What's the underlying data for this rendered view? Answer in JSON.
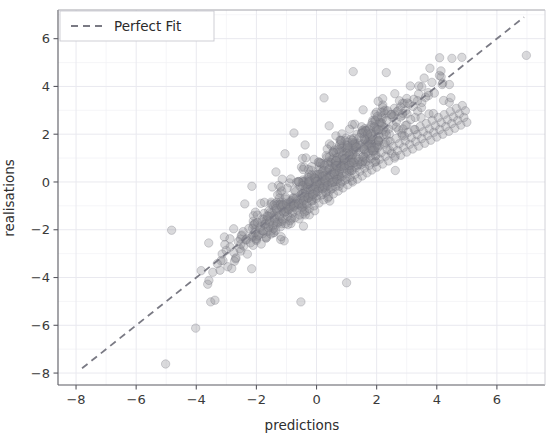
{
  "chart_data": {
    "type": "scatter",
    "title": "",
    "xlabel": "predictions",
    "ylabel": "realisations",
    "xlim": [
      -8.6,
      7.6
    ],
    "ylim": [
      -8.5,
      7.2
    ],
    "xticks": [
      -8,
      -6,
      -4,
      -2,
      0,
      2,
      4,
      6
    ],
    "yticks": [
      -8,
      -6,
      -4,
      -2,
      0,
      2,
      4,
      6
    ],
    "xticklabels": [
      "−8",
      "−6",
      "−4",
      "−2",
      "0",
      "2",
      "4",
      "6"
    ],
    "yticklabels": [
      "−8",
      "−6",
      "−4",
      "−2",
      "0",
      "2",
      "4",
      "6"
    ],
    "grid": true,
    "grid_minor": true,
    "grid_color": "#e9e9ef",
    "legend": {
      "position": "upper left",
      "entries": [
        {
          "label": "Perfect Fit",
          "style": "dashed-line",
          "color": "#7a7a84"
        }
      ]
    },
    "reference_line": {
      "name": "Perfect Fit",
      "type": "identity",
      "from": [
        -7.8,
        -7.8
      ],
      "to": [
        6.9,
        6.9
      ],
      "color": "#7a7a84",
      "dash": "7,5",
      "width": 1.8
    },
    "marker": {
      "shape": "circle",
      "radius": 4.2,
      "fill": "#8c8c93",
      "fill_opacity": 0.32,
      "stroke": "#6f6f78",
      "stroke_opacity": 0.42,
      "stroke_width": 0.7
    },
    "series": [
      {
        "name": "predictions vs realisations",
        "n_points": 620,
        "correlation": 0.95,
        "points": [
          [
            -5.02,
            -7.62
          ],
          [
            -4.02,
            -6.12
          ],
          [
            -4.82,
            -2.02
          ],
          [
            -3.52,
            -5.02
          ],
          [
            -3.38,
            -4.95
          ],
          [
            -3.62,
            -4.28
          ],
          [
            -3.58,
            -4.12
          ],
          [
            -3.45,
            -3.78
          ],
          [
            -3.3,
            -3.42
          ],
          [
            -3.18,
            -3.3
          ],
          [
            -3.05,
            -2.62
          ],
          [
            -2.95,
            -3.55
          ],
          [
            -2.88,
            -2.38
          ],
          [
            -2.82,
            -3.62
          ],
          [
            -2.75,
            -2.95
          ],
          [
            -2.68,
            -3.18
          ],
          [
            -2.6,
            -2.5
          ],
          [
            -2.55,
            -2.8
          ],
          [
            -2.48,
            -2.22
          ],
          [
            -2.42,
            -2.68
          ],
          [
            -2.35,
            -2.42
          ],
          [
            -2.3,
            -3.02
          ],
          [
            -2.25,
            -1.95
          ],
          [
            -2.2,
            -2.55
          ],
          [
            -2.15,
            -2.3
          ],
          [
            -2.1,
            -1.8
          ],
          [
            -2.05,
            -2.12
          ],
          [
            -2.0,
            -2.45
          ],
          [
            -1.96,
            -1.7
          ],
          [
            -1.92,
            -2.22
          ],
          [
            -1.88,
            -1.92
          ],
          [
            -1.84,
            -2.6
          ],
          [
            -1.8,
            -1.55
          ],
          [
            -1.76,
            -2.05
          ],
          [
            -1.72,
            -1.78
          ],
          [
            -1.68,
            -2.35
          ],
          [
            -1.64,
            -1.42
          ],
          [
            -1.6,
            -1.92
          ],
          [
            -1.56,
            -1.65
          ],
          [
            -1.52,
            -2.18
          ],
          [
            -1.48,
            -1.3
          ],
          [
            -1.44,
            -1.8
          ],
          [
            -1.4,
            -1.52
          ],
          [
            -1.36,
            -2.02
          ],
          [
            -1.32,
            -1.18
          ],
          [
            -1.28,
            -1.68
          ],
          [
            -1.24,
            -1.4
          ],
          [
            -1.2,
            -1.88
          ],
          [
            -1.16,
            -1.05
          ],
          [
            -1.12,
            -1.55
          ],
          [
            -1.08,
            -1.28
          ],
          [
            -1.04,
            -1.75
          ],
          [
            -1.0,
            -0.92
          ],
          [
            -0.96,
            -1.42
          ],
          [
            -0.92,
            -1.15
          ],
          [
            -0.88,
            -1.62
          ],
          [
            -0.84,
            -0.8
          ],
          [
            -0.8,
            -1.3
          ],
          [
            -0.76,
            -1.02
          ],
          [
            -0.72,
            -1.5
          ],
          [
            -0.68,
            -0.68
          ],
          [
            -0.64,
            -1.18
          ],
          [
            -0.6,
            -0.9
          ],
          [
            -0.56,
            -1.38
          ],
          [
            -0.52,
            -0.55
          ],
          [
            -0.48,
            -1.05
          ],
          [
            -0.44,
            -0.78
          ],
          [
            -0.4,
            -1.25
          ],
          [
            -0.36,
            -0.42
          ],
          [
            -0.32,
            -0.92
          ],
          [
            -0.28,
            -0.65
          ],
          [
            -0.24,
            -1.12
          ],
          [
            -0.2,
            -0.3
          ],
          [
            -0.16,
            -0.8
          ],
          [
            -0.12,
            -0.52
          ],
          [
            -0.08,
            -1.0
          ],
          [
            -0.04,
            -0.18
          ],
          [
            0.0,
            -0.68
          ],
          [
            0.04,
            -0.4
          ],
          [
            0.08,
            -0.88
          ],
          [
            0.12,
            -0.05
          ],
          [
            0.16,
            -0.55
          ],
          [
            0.2,
            -0.28
          ],
          [
            0.24,
            -0.75
          ],
          [
            0.28,
            0.08
          ],
          [
            0.32,
            -0.42
          ],
          [
            0.36,
            -0.15
          ],
          [
            0.4,
            -0.62
          ],
          [
            0.44,
            0.2
          ],
          [
            0.48,
            -0.3
          ],
          [
            0.52,
            -0.02
          ],
          [
            0.56,
            -0.5
          ],
          [
            0.6,
            0.32
          ],
          [
            0.64,
            -0.18
          ],
          [
            0.68,
            0.1
          ],
          [
            0.72,
            -0.38
          ],
          [
            0.76,
            0.45
          ],
          [
            0.8,
            -0.05
          ],
          [
            0.84,
            0.22
          ],
          [
            0.88,
            -0.25
          ],
          [
            0.92,
            0.58
          ],
          [
            0.96,
            0.08
          ],
          [
            1.0,
            0.35
          ],
          [
            1.04,
            -0.12
          ],
          [
            1.08,
            0.7
          ],
          [
            1.12,
            0.2
          ],
          [
            1.16,
            0.48
          ],
          [
            1.2,
            0.0
          ],
          [
            1.24,
            0.82
          ],
          [
            1.28,
            0.32
          ],
          [
            1.32,
            0.6
          ],
          [
            1.36,
            0.12
          ],
          [
            1.4,
            0.95
          ],
          [
            1.44,
            0.45
          ],
          [
            1.48,
            0.72
          ],
          [
            1.52,
            0.25
          ],
          [
            1.56,
            1.08
          ],
          [
            1.6,
            0.58
          ],
          [
            1.64,
            0.85
          ],
          [
            1.68,
            0.38
          ],
          [
            1.72,
            1.2
          ],
          [
            1.76,
            0.7
          ],
          [
            1.8,
            0.98
          ],
          [
            1.84,
            0.5
          ],
          [
            1.88,
            1.32
          ],
          [
            1.92,
            0.82
          ],
          [
            1.96,
            1.1
          ],
          [
            2.0,
            0.62
          ],
          [
            2.05,
            1.45
          ],
          [
            2.1,
            0.95
          ],
          [
            2.15,
            1.22
          ],
          [
            2.2,
            0.75
          ],
          [
            2.25,
            1.58
          ],
          [
            2.3,
            1.08
          ],
          [
            2.35,
            1.35
          ],
          [
            2.4,
            0.88
          ],
          [
            2.45,
            1.7
          ],
          [
            2.5,
            1.2
          ],
          [
            2.55,
            1.48
          ],
          [
            2.6,
            1.0
          ],
          [
            2.65,
            1.82
          ],
          [
            2.7,
            1.32
          ],
          [
            2.75,
            1.6
          ],
          [
            2.8,
            1.12
          ],
          [
            2.85,
            1.95
          ],
          [
            2.9,
            1.45
          ],
          [
            2.95,
            1.72
          ],
          [
            3.0,
            1.25
          ],
          [
            3.05,
            2.08
          ],
          [
            3.1,
            1.58
          ],
          [
            3.15,
            1.85
          ],
          [
            3.2,
            1.38
          ],
          [
            3.25,
            2.2
          ],
          [
            3.3,
            1.7
          ],
          [
            3.35,
            1.98
          ],
          [
            3.4,
            1.5
          ],
          [
            3.45,
            2.32
          ],
          [
            3.5,
            1.82
          ],
          [
            3.55,
            2.1
          ],
          [
            3.6,
            1.62
          ],
          [
            3.65,
            2.45
          ],
          [
            3.7,
            1.95
          ],
          [
            3.75,
            2.22
          ],
          [
            3.8,
            1.75
          ],
          [
            3.85,
            2.58
          ],
          [
            3.9,
            2.08
          ],
          [
            3.95,
            2.35
          ],
          [
            4.0,
            1.88
          ],
          [
            4.05,
            2.7
          ],
          [
            4.1,
            2.2
          ],
          [
            4.15,
            2.48
          ],
          [
            4.2,
            2.0
          ],
          [
            4.25,
            2.82
          ],
          [
            4.3,
            2.32
          ],
          [
            4.35,
            2.6
          ],
          [
            4.4,
            2.12
          ],
          [
            4.45,
            2.95
          ],
          [
            4.5,
            2.45
          ],
          [
            4.55,
            2.72
          ],
          [
            4.6,
            2.25
          ],
          [
            4.65,
            3.08
          ],
          [
            4.7,
            2.58
          ],
          [
            4.75,
            2.85
          ],
          [
            4.8,
            2.38
          ],
          [
            4.85,
            3.2
          ],
          [
            4.9,
            2.7
          ],
          [
            4.95,
            2.98
          ],
          [
            5.0,
            2.5
          ],
          [
            1.0,
            -4.22
          ],
          [
            -0.52,
            -5.02
          ],
          [
            6.98,
            5.3
          ],
          [
            4.18,
            4.08
          ],
          [
            2.62,
            0.48
          ],
          [
            -1.05,
            1.18
          ],
          [
            -0.38,
            1.55
          ],
          [
            0.42,
            2.35
          ],
          [
            1.55,
            3.02
          ],
          [
            2.05,
            3.38
          ],
          [
            3.12,
            4.02
          ],
          [
            3.58,
            4.35
          ],
          [
            4.42,
            4.08
          ],
          [
            2.32,
            4.58
          ],
          [
            1.22,
            4.62
          ],
          [
            0.25,
            3.52
          ],
          [
            -1.35,
            0.42
          ],
          [
            -2.15,
            -0.18
          ],
          [
            -0.75,
            2.05
          ],
          [
            3.92,
            3.72
          ]
        ]
      }
    ]
  },
  "axes": {
    "xlabel": "predictions",
    "ylabel": "realisations"
  },
  "legend": {
    "perfect_fit_label": "Perfect Fit"
  }
}
